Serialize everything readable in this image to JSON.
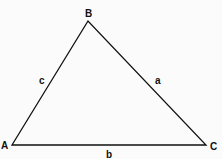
{
  "diagram": {
    "type": "triangle",
    "vertices": {
      "A": {
        "label": "A",
        "x": 12,
        "y": 145
      },
      "B": {
        "label": "B",
        "x": 88,
        "y": 21
      },
      "C": {
        "label": "C",
        "x": 206,
        "y": 145
      }
    },
    "sides": {
      "a": {
        "label": "a",
        "between": "B-C"
      },
      "b": {
        "label": "b",
        "between": "A-C"
      },
      "c": {
        "label": "c",
        "between": "A-B"
      }
    },
    "colors": {
      "stroke": "#111111",
      "background": "#fbfbfb"
    }
  }
}
